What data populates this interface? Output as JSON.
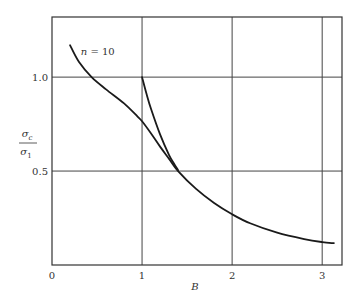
{
  "chart_data": {
    "type": "line",
    "title": "",
    "xlabel": "B",
    "ylabel": {
      "numerator": "σc",
      "numerator_base": "σ",
      "numerator_sub": "c",
      "denominator_base": "σ",
      "denominator_sub": "1"
    },
    "xlim": [
      0,
      3.22
    ],
    "ylim": [
      0,
      1.32
    ],
    "grid": true,
    "x_ticks": [
      {
        "value": 0,
        "label": "0"
      },
      {
        "value": 1,
        "label": "1"
      },
      {
        "value": 2,
        "label": "2"
      },
      {
        "value": 3,
        "label": "3"
      }
    ],
    "y_ticks": [
      {
        "value": 0.5,
        "label": "0.5"
      },
      {
        "value": 1.0,
        "label": "1.0"
      }
    ],
    "annotations": [
      {
        "text_var": "n",
        "text_rest": " = 10",
        "x": 0.32,
        "y": 1.12
      }
    ],
    "series": [
      {
        "name": "n = 10 main curve",
        "points": [
          [
            0.2,
            1.17
          ],
          [
            0.3,
            1.08
          ],
          [
            0.44,
            1.0
          ],
          [
            0.6,
            0.935
          ],
          [
            0.8,
            0.86
          ],
          [
            0.95,
            0.79
          ],
          [
            1.0,
            0.765
          ],
          [
            1.1,
            0.7
          ],
          [
            1.2,
            0.63
          ],
          [
            1.3,
            0.565
          ],
          [
            1.4,
            0.5
          ],
          [
            1.6,
            0.405
          ],
          [
            1.8,
            0.33
          ],
          [
            2.0,
            0.27
          ],
          [
            2.2,
            0.222
          ],
          [
            2.5,
            0.172
          ],
          [
            2.8,
            0.138
          ],
          [
            3.0,
            0.122
          ],
          [
            3.13,
            0.116
          ]
        ]
      },
      {
        "name": "n = 10 branch from B = 1",
        "points": [
          [
            1.0,
            1.0
          ],
          [
            1.05,
            0.91
          ],
          [
            1.1,
            0.83
          ],
          [
            1.2,
            0.695
          ],
          [
            1.3,
            0.585
          ],
          [
            1.36,
            0.535
          ],
          [
            1.4,
            0.505
          ]
        ]
      }
    ]
  }
}
